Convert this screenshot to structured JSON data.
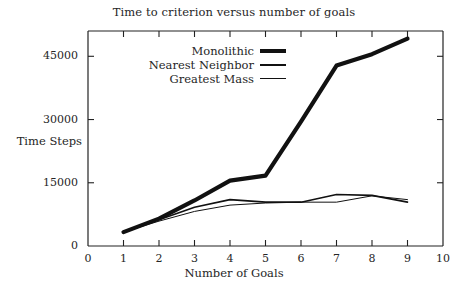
{
  "chart_data": {
    "type": "line",
    "title": "Time to criterion versus number of goals",
    "xlabel": "Number of Goals",
    "ylabel": "Time Steps",
    "xlim": [
      0,
      10
    ],
    "ylim": [
      0,
      51000
    ],
    "grid": false,
    "legend_position": "top-left-inside",
    "xticks": [
      "0",
      "1",
      "2",
      "3",
      "4",
      "5",
      "6",
      "7",
      "8",
      "9",
      "10"
    ],
    "xtick_values": [
      0,
      1,
      2,
      3,
      4,
      5,
      6,
      7,
      8,
      9,
      10
    ],
    "yticks": [
      "0",
      "15000",
      "30000",
      "45000"
    ],
    "ytick_values": [
      0,
      15000,
      30000,
      45000
    ],
    "x": [
      1,
      2,
      3,
      4,
      5,
      6,
      7,
      8,
      9
    ],
    "series": [
      {
        "name": "Monolithic",
        "style": "thick",
        "values": [
          3300,
          6500,
          10800,
          15500,
          16700,
          29500,
          42800,
          45500,
          49200
        ]
      },
      {
        "name": "Nearest Neighbor",
        "style": "medium",
        "values": [
          3300,
          6200,
          9200,
          11000,
          10400,
          10400,
          12200,
          12000,
          10400
        ]
      },
      {
        "name": "Greatest Mass",
        "style": "thin",
        "values": [
          3300,
          5900,
          8200,
          9700,
          10200,
          10400,
          10400,
          11900,
          11000
        ]
      }
    ]
  },
  "legend": {
    "items": [
      {
        "label": "Monolithic",
        "style": "thick"
      },
      {
        "label": "Nearest Neighbor",
        "style": "medium"
      },
      {
        "label": "Greatest Mass",
        "style": "thin"
      }
    ]
  }
}
